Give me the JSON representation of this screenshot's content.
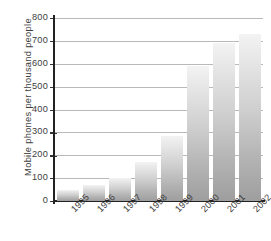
{
  "chart_data": {
    "type": "bar",
    "title": "",
    "xlabel": "",
    "ylabel": "Mobile phones per thousand people",
    "categories": [
      "1995",
      "1996",
      "1997",
      "1998",
      "1999",
      "2000",
      "2001",
      "2002"
    ],
    "values": [
      50,
      70,
      100,
      170,
      285,
      590,
      690,
      730
    ],
    "ylim": [
      0,
      800
    ],
    "yticks": [
      0,
      100,
      200,
      300,
      400,
      500,
      600,
      700,
      800
    ],
    "ytick_labels": [
      "0",
      "100",
      "200",
      "300",
      "400",
      "500",
      "600",
      "700",
      "800"
    ],
    "grid": true,
    "legend": false,
    "bar_color_top": "#f3f3f3",
    "bar_color_bottom": "#9e9e9e",
    "axis_color": "#222222",
    "grid_color": "#b9b9b9",
    "background": "#ffffff"
  }
}
